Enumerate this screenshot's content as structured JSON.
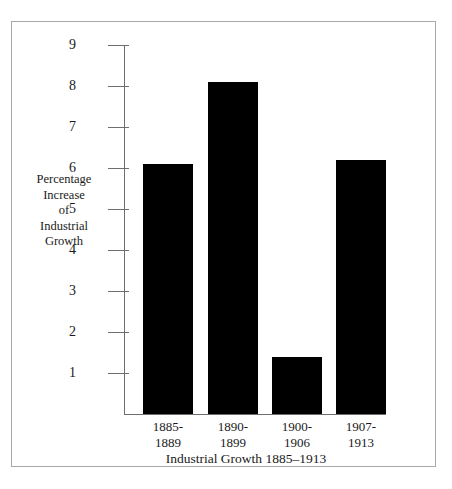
{
  "chart_data": {
    "type": "bar",
    "title": "",
    "xlabel": "Industrial Growth 1885–1913",
    "ylabel": "Percentage Increase of Industrial Growth",
    "ylabel_lines": [
      "Percentage",
      "Increase",
      "of",
      "Industrial",
      "Growth"
    ],
    "categories": [
      "1885-1889",
      "1890-1899",
      "1900-1906",
      "1907-1913"
    ],
    "category_lines": [
      [
        "1885-",
        "1889"
      ],
      [
        "1890-",
        "1899"
      ],
      [
        "1900-",
        "1906"
      ],
      [
        "1907-",
        "1913"
      ]
    ],
    "values": [
      6.1,
      8.1,
      1.4,
      6.2
    ],
    "ylim": [
      0,
      9
    ],
    "ytick_labels": [
      "9",
      "8",
      "7",
      "6",
      "5",
      "4",
      "3",
      "2",
      "1"
    ],
    "ytick_values": [
      9,
      8,
      7,
      6,
      5,
      4,
      3,
      2,
      1
    ],
    "grid": false,
    "legend": "none",
    "bar_color": "#000000",
    "axis_color": "#6e6e6e",
    "border_color": "#a8a8a8",
    "background_color": "#ffffff",
    "text_color": "#1a1a1a"
  }
}
